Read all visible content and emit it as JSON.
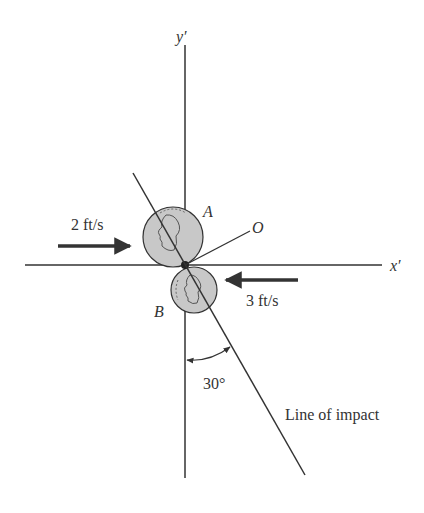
{
  "diagram": {
    "type": "collision-of-two-coins",
    "axes": {
      "y_label": "y′",
      "x_label": "x′"
    },
    "points": {
      "coin_a_label": "A",
      "coin_b_label": "B",
      "origin_label": "O"
    },
    "velocities": {
      "coin_a_speed": "2 ft/s",
      "coin_a_direction": "right",
      "coin_b_speed": "3 ft/s",
      "coin_b_direction": "left"
    },
    "angle": {
      "value": "30°",
      "between": [
        "y′ axis",
        "line of impact"
      ]
    },
    "line_of_impact_label": "Line of impact",
    "colors": {
      "line": "#333333",
      "coin_fill": "#c8c8c8",
      "background": "#ffffff"
    }
  }
}
